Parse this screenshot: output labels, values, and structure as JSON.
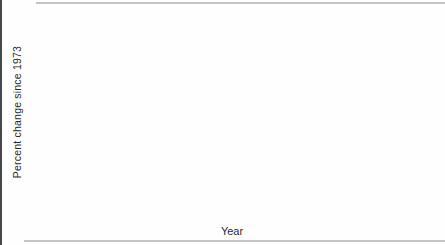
{
  "figure": {
    "y_axis_label": "Percent change since 1973",
    "x_axis_label": "Year"
  },
  "chart_data": {
    "type": "line",
    "title": "",
    "xlabel": "Year",
    "ylabel": "Percent change since 1973",
    "xlim": [
      1973,
      1994
    ],
    "ylim": [
      -10,
      90
    ],
    "grid": false,
    "legend_position": "inline-labels",
    "axis_color": "#2f3032",
    "text_color": "#222325",
    "yticks": [
      90,
      80,
      70,
      60,
      50,
      40,
      30,
      20,
      10,
      0,
      -10
    ],
    "xticks_labeled": [
      1973,
      1975,
      1977,
      1979,
      1981,
      1983,
      1985,
      1987,
      1989,
      1991,
      1993
    ],
    "x": [
      1973,
      1974,
      1975,
      1976,
      1977,
      1978,
      1979,
      1980,
      1981,
      1982,
      1983,
      1984,
      1985,
      1986,
      1987,
      1988,
      1989,
      1990,
      1991,
      1992,
      1993,
      1994
    ],
    "series": [
      {
        "id": "motor-vehicle-theft",
        "name": "Motor-vehicle theft",
        "color": "#b5b7b9",
        "values": [
          0,
          5,
          9,
          4,
          5,
          8,
          18,
          22,
          17,
          11,
          10,
          10,
          19,
          30,
          38,
          54,
          68,
          44,
          43,
          34,
          26,
          19
        ],
        "label": {
          "lines": [
            "Motor-vehicle",
            "theft"
          ],
          "x": 391,
          "y": 126,
          "anchor": "end"
        }
      },
      {
        "id": "burglary",
        "name": "Burglary",
        "color": "#5d5e61",
        "values": [
          0,
          18,
          27,
          21,
          20,
          21,
          30,
          48,
          47,
          36,
          30,
          19,
          17,
          25,
          26,
          25,
          22,
          16,
          15,
          10,
          5,
          2
        ],
        "label": {
          "lines": [
            "Burglary"
          ],
          "x": 347,
          "y": 187,
          "anchor": "start"
        }
      },
      {
        "id": "larceny",
        "name": "Larceny",
        "color": "#707174",
        "values": [
          0,
          22,
          36,
          44,
          37,
          38,
          50,
          64,
          65,
          63,
          54,
          52,
          57,
          63,
          70,
          75,
          81,
          50,
          55,
          49,
          46,
          46
        ],
        "label": {
          "lines": [
            "Larceny"
          ],
          "x": 384,
          "y": 81,
          "anchor": "start"
        }
      }
    ]
  }
}
